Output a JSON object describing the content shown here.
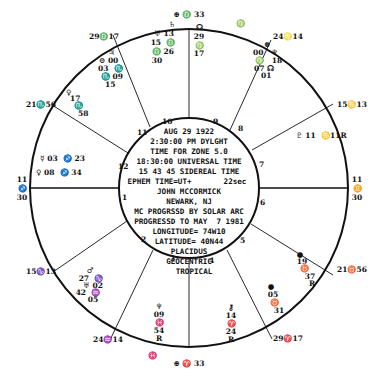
{
  "chart_title": "Natal horoscope wheel",
  "center": {
    "lines": [
      "AUG 29 1922",
      "2:30:00 PM DYLGHT",
      "TIME FOR ZONE  5.0",
      "18:30:00 UNIVERSAL TIME",
      "15 43 45 SIDEREAL TIME",
      "EPHEM TIME=UT+       22sec",
      "JOHN MCCORMICK",
      "NEWARK, NJ",
      "MC PROGRSSD BY SOLAR ARC",
      "PROGRESSD TO MAY  7 1981",
      "LONGITUDE= 74W10",
      "LATITUDE= 40N44",
      "PLACIDUS",
      "GEOCENTRIC",
      "TROPICAL"
    ]
  },
  "house_numbers": [
    "1",
    "2",
    "3",
    "4",
    "5",
    "6",
    "7",
    "8",
    "9",
    "10",
    "11",
    "12"
  ],
  "cusps": {
    "mc": "⊕ ♎ 33",
    "ic": "⊕ ♈ 33",
    "asc": [
      "11",
      "♐",
      "30"
    ],
    "dsc": [
      "11",
      "♊",
      "30"
    ],
    "c11": "29♎17",
    "c12": "21♏56",
    "c2": "15♑13",
    "c3": "24♒14",
    "c5": "29♈17",
    "c6": "21♉56",
    "c8": "15♋13",
    "c9": "24♌14"
  },
  "planets": {
    "house10_left": [
      "♄",
      "♅ 13",
      "15  ♎",
      "♎ 26",
      "30"
    ],
    "house10_right": [
      "☊",
      "29",
      "♍",
      "17"
    ],
    "house9": [
      "⊗",
      "00   ♆",
      "♍   18",
      "07 ☊",
      "01"
    ],
    "house9_edge": "♍",
    "house11": [
      "♃",
      "⊙ 00",
      "03  ♏",
      "♏ 09",
      "15"
    ],
    "house12": [
      "♀",
      "17",
      "♏",
      "58"
    ],
    "house1": [
      "☿ 03  ♐ 23",
      "♀ 08  ♐ 34"
    ],
    "house8": "♇ 11  ♋11R",
    "house2": [
      "♂",
      "27  ♑",
      "♅ 02",
      "42  ♒",
      "05"
    ],
    "house3": [
      "♆",
      "09",
      "♓",
      "54",
      "R"
    ],
    "house3_edge": "♓",
    "house4": [
      "⚷",
      "14",
      "♈",
      "24",
      "R"
    ],
    "house5": [
      "●",
      "05",
      "♉",
      "31"
    ],
    "house6": [
      "●",
      "19",
      "♉",
      "37",
      "R"
    ]
  }
}
